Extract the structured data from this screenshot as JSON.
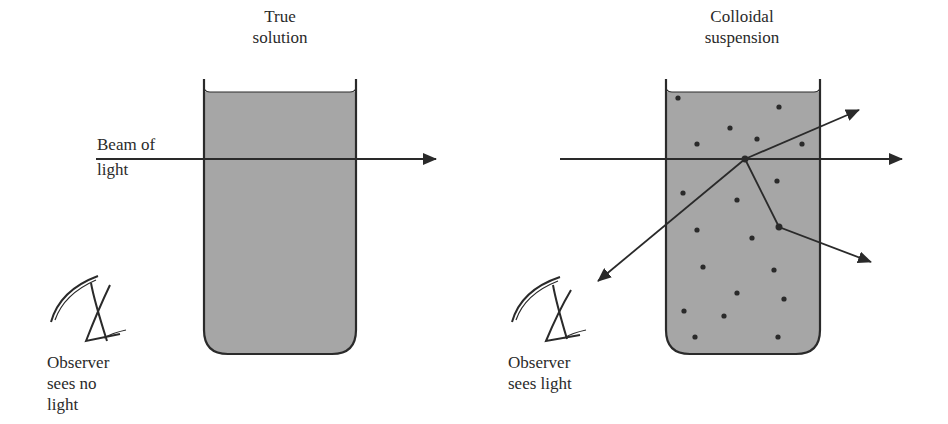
{
  "left_panel": {
    "title_line1": "True",
    "title_line2": "solution",
    "beam_label_line1": "Beam of",
    "beam_label_line2": "light",
    "observer_line1": "Observer",
    "observer_line2": "sees no",
    "observer_line3": "light"
  },
  "right_panel": {
    "title_line1": "Colloidal",
    "title_line2": "suspension",
    "observer_line1": "Observer",
    "observer_line2": "sees light"
  },
  "colors": {
    "liquid": "#a6a6a6",
    "ink": "#2a2a2a"
  }
}
